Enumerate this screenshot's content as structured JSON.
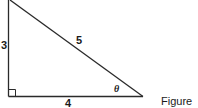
{
  "diagram": {
    "type": "right-triangle",
    "sides": {
      "vertical": "3",
      "hypotenuse": "5",
      "horizontal": "4"
    },
    "angle_label": "θ",
    "right_angle_marker": true,
    "caption": "Figure",
    "stroke_color": "#2a2a2a"
  }
}
